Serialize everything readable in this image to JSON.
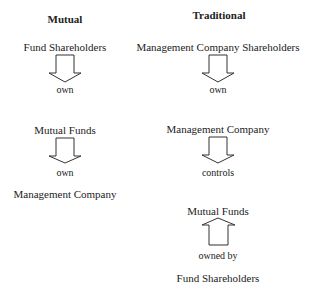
{
  "columns": [
    {
      "heading": "Mutual",
      "nodes": [
        "Fund Shareholders",
        "Mutual Funds",
        "Management Company"
      ],
      "relations": [
        {
          "label": "own",
          "direction": "down"
        },
        {
          "label": "own",
          "direction": "down"
        }
      ]
    },
    {
      "heading": "Traditional",
      "nodes": [
        "Management Company Shareholders",
        "Management Company",
        "Mutual Funds",
        "Fund Shareholders"
      ],
      "relations": [
        {
          "label": "own",
          "direction": "down"
        },
        {
          "label": "controls",
          "direction": "down"
        },
        {
          "label": "owned by",
          "direction": "up"
        }
      ]
    }
  ],
  "icons": {
    "down": "arrow-down-icon",
    "up": "arrow-up-icon"
  }
}
